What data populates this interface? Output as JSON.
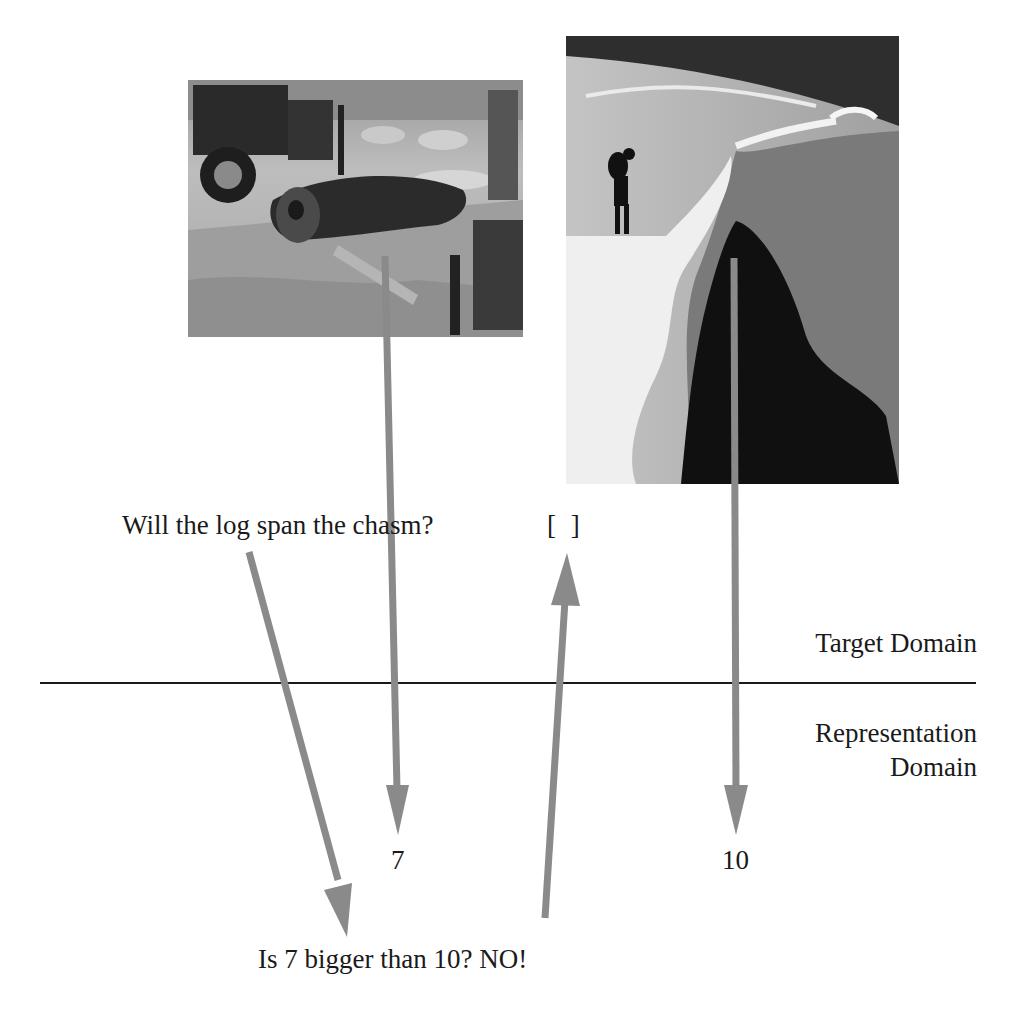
{
  "diagram": {
    "question": "Will the log span the chasm?",
    "answer_box": "[ ]",
    "target_domain_label": "Target Domain",
    "representation_domain_label_line1": "Representation",
    "representation_domain_label_line2": "Domain",
    "log_value": "7",
    "chasm_value": "10",
    "comparison": "Is 7 bigger than 10? NO!",
    "photos": [
      {
        "subject": "log-on-tractor-photo"
      },
      {
        "subject": "climber-at-crevasse-photo"
      }
    ],
    "colors": {
      "arrow": "#8a8a8a",
      "divider": "#1a1a1a",
      "text": "#1a1a1a"
    }
  }
}
